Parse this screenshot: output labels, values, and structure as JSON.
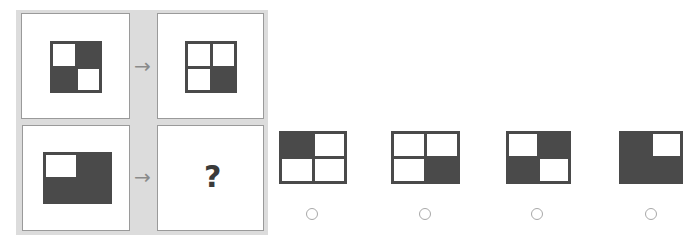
{
  "puzzle": {
    "question_mark": "?",
    "arrow_glyph": "→",
    "examples": [
      {
        "name": "top-left",
        "cells": [
          "white",
          "dark",
          "dark",
          "white"
        ]
      },
      {
        "name": "top-right",
        "cells": [
          "white",
          "white",
          "white",
          "dark"
        ]
      },
      {
        "name": "bottom-left",
        "cells": [
          "white",
          "dark",
          "dark",
          "dark"
        ]
      }
    ]
  },
  "options": [
    {
      "name": "option-a",
      "cells": [
        "dark",
        "white",
        "white",
        "white"
      ],
      "selected": false
    },
    {
      "name": "option-b",
      "cells": [
        "white",
        "white",
        "white",
        "dark"
      ],
      "selected": false
    },
    {
      "name": "option-c",
      "cells": [
        "white",
        "dark",
        "dark",
        "white"
      ],
      "selected": false
    },
    {
      "name": "option-d",
      "cells": [
        "dark",
        "white",
        "dark",
        "dark"
      ],
      "selected": false
    }
  ],
  "colors": {
    "dark": "#4a4a4a",
    "panel": "#dcdcdc",
    "border": "#9a9a9a"
  }
}
